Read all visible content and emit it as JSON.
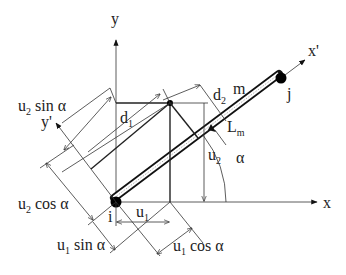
{
  "figure": {
    "axes": {
      "x": "x",
      "y": "y",
      "x_local": "x'",
      "y_local": "y'"
    },
    "nodes": {
      "start": "i",
      "end": "j"
    },
    "member": {
      "label": "m",
      "length_label": "L",
      "length_sub": "m"
    },
    "angle": "α",
    "displacements": {
      "u1": {
        "base": "u",
        "sub": "1"
      },
      "u2": {
        "base": "u",
        "sub": "2"
      },
      "d1": {
        "base": "d",
        "sub": "1"
      },
      "d2": {
        "base": "d",
        "sub": "2"
      }
    },
    "projections": {
      "u2_sin": {
        "base": "u",
        "sub": "2",
        "rest": " sin α"
      },
      "u2_cos": {
        "base": "u",
        "sub": "2",
        "rest": " cos α"
      },
      "u1_sin": {
        "base": "u",
        "sub": "1",
        "rest": " sin α"
      },
      "u1_cos": {
        "base": "u",
        "sub": "1",
        "rest": " cos α"
      }
    },
    "colors": {
      "line": "#222222",
      "background": "#ffffff",
      "member_fill": "#dddddd"
    }
  }
}
